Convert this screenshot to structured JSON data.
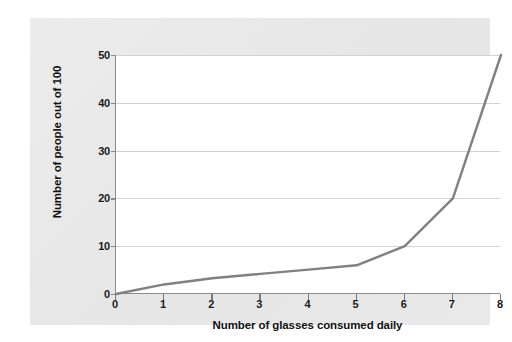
{
  "chart_data": {
    "type": "line",
    "title": "",
    "subtitle": "",
    "xlabel": "Number of glasses consumed daily",
    "ylabel": "Number of people out of 100",
    "x": [
      0,
      1,
      2,
      3,
      4,
      5,
      6,
      7,
      8
    ],
    "series": [
      {
        "name": "People out of 100",
        "values": [
          0,
          2,
          3.3,
          4.2,
          5.1,
          6,
          10,
          20,
          50
        ],
        "color": "#808080"
      }
    ],
    "xlim": [
      0,
      8
    ],
    "ylim": [
      0,
      50
    ],
    "x_ticks": [
      "0",
      "1",
      "2",
      "3",
      "4",
      "5",
      "6",
      "7",
      "8"
    ],
    "y_ticks": [
      "0",
      "10",
      "20",
      "30",
      "40",
      "50"
    ],
    "x_tick_values": [
      0,
      1,
      2,
      3,
      4,
      5,
      6,
      7,
      8
    ],
    "y_tick_values": [
      0,
      10,
      20,
      30,
      40,
      50
    ],
    "grid": "horizontal",
    "legend": "none",
    "annotations": []
  },
  "colors": {
    "panel_background": "#e9e9e9",
    "plot_background": "#ffffff",
    "line": "#808080",
    "gridline": "#d2d2d2",
    "axis": "#8c8c8c",
    "text": "#111111"
  }
}
